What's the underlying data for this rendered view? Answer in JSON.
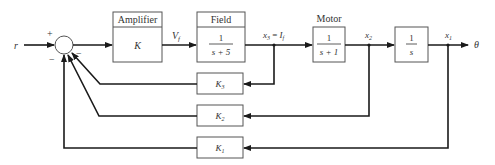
{
  "diagram": {
    "type": "block-diagram",
    "input_label": "r",
    "output_label": "θ",
    "summing_junction": {
      "signs": {
        "top": "+",
        "bottom_left": "−",
        "right": "−",
        "bottom": "−"
      }
    },
    "blocks": {
      "amplifier": {
        "title": "Amplifier",
        "gain": "K"
      },
      "field": {
        "title": "Field",
        "num": "1",
        "den": "s + 5"
      },
      "motor": {
        "title": "Motor",
        "num": "1",
        "den": "s + 1"
      },
      "integrator": {
        "num": "1",
        "den": "s"
      },
      "k3": {
        "label": "K₃"
      },
      "k2": {
        "label": "K₂"
      },
      "k1": {
        "label": "K₁"
      }
    },
    "signals": {
      "vf": "V_f",
      "x3": "x₃ = I_f",
      "x2": "x₂",
      "x1": "x₁"
    }
  }
}
